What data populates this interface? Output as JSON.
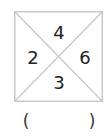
{
  "figure": {
    "numbers": {
      "top": "4",
      "left": "2",
      "right": "6",
      "bottom": "3"
    },
    "answer": {
      "open": "(",
      "close": ")"
    },
    "colors": {
      "line": "#c8c8c8",
      "text": "#222222"
    }
  }
}
